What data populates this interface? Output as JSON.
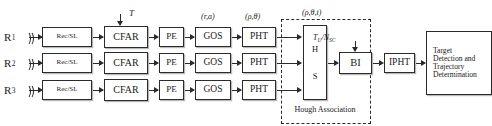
{
  "diagram": {
    "receivers": [
      {
        "id": "R1",
        "base": "R",
        "sub": "1",
        "icon": "antenna-icon"
      },
      {
        "id": "R2",
        "base": "R",
        "sub": "2",
        "icon": "antenna-icon"
      },
      {
        "id": "R3",
        "base": "R",
        "sub": "3",
        "icon": "antenna-icon"
      }
    ],
    "stages": [
      {
        "key": "recsl",
        "label": "Rec/SL"
      },
      {
        "key": "cfar",
        "label": "CFAR"
      },
      {
        "key": "pe",
        "label": "PE"
      },
      {
        "key": "gos",
        "label": "GOS"
      },
      {
        "key": "pht",
        "label": "PHT"
      }
    ],
    "rows": [
      {
        "receiver": "R1",
        "blocks": [
          "Rec/SL",
          "CFAR",
          "PE",
          "GOS",
          "PHT"
        ]
      },
      {
        "receiver": "R2",
        "blocks": [
          "Rec/SL",
          "CFAR",
          "PE",
          "GOS",
          "PHT"
        ]
      },
      {
        "receiver": "R3",
        "blocks": [
          "Rec/SL",
          "CFAR",
          "PE",
          "GOS",
          "PHT"
        ]
      }
    ],
    "annotations": {
      "threshold": "T",
      "range_angle": "(r,a)",
      "rho_theta": "(ρ,θ)",
      "rho_theta_t": "(ρ,θ,t)",
      "tu_nsc_base": "T",
      "tu_nsc_sub1": "U",
      "tu_nsc_mid": "/N",
      "tu_nsc_sub2": "SC"
    },
    "hough": {
      "hs_line1": "H",
      "hs_line2": "S",
      "caption": "Hough Association",
      "bi_label": "BI"
    },
    "ipht": {
      "label": "IPHT"
    },
    "final": {
      "line1": "Target",
      "line2": "Detection  and",
      "line3": "Trajectory",
      "line4": "Determination"
    },
    "colors": {
      "stroke": "#2b2b2b",
      "shadow": "#b9b9b9",
      "background": "#ffffff"
    }
  }
}
